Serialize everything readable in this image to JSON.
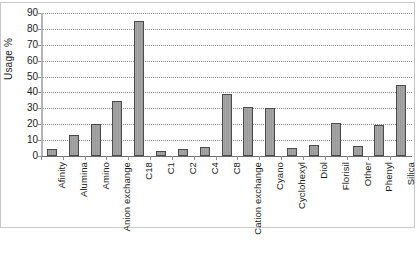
{
  "chart_data": {
    "type": "bar",
    "title": "",
    "xlabel": "",
    "ylabel": "Usage %",
    "ylim": [
      0,
      90
    ],
    "yticks": [
      0,
      10,
      20,
      30,
      40,
      50,
      60,
      70,
      80,
      90
    ],
    "ytick_labels": [
      "0",
      "10",
      "20",
      "30",
      "40",
      "50",
      "60",
      "70",
      "80",
      "90"
    ],
    "grid": true,
    "grid_style": "dotted-horizontal",
    "legend": "none",
    "bar_fill_color": "#a0a0a0",
    "bar_border_color": "#4a4a4a",
    "background_color": "#ffffff",
    "categories": [
      "Afinity",
      "Alumina",
      "Amino",
      "Anion exchange",
      "C18",
      "C1",
      "C2",
      "C4",
      "C8",
      "Cation exchange",
      "Cyano",
      "Cyclohexyl",
      "Diol",
      "Florisil",
      "Other",
      "Phenyl",
      "Silica"
    ],
    "values": [
      4.5,
      13,
      20,
      34.5,
      85,
      3,
      4.5,
      5.5,
      39,
      31,
      30,
      5,
      7,
      21,
      6,
      19.5,
      44.5
    ]
  }
}
